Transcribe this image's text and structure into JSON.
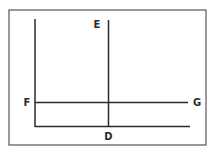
{
  "diagram": {
    "type": "supply-demand style line diagram",
    "labels": {
      "top_of_vertical_line": "E",
      "bottom_of_vertical_line": "D",
      "left_of_horizontal_line": "F",
      "right_of_horizontal_line": "G"
    },
    "elements": [
      "frame border",
      "vertical axis",
      "horizontal axis",
      "vertical line D–E",
      "horizontal line F–G"
    ],
    "colors": {
      "ink": "#2a2a2a",
      "frame": "#555555",
      "background": "#ffffff"
    }
  }
}
